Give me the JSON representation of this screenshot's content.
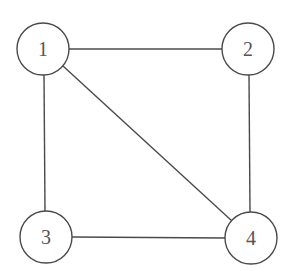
{
  "diagram": {
    "type": "undirected-graph",
    "colors": {
      "stroke": "#4a4a4a",
      "label": "#555555",
      "background": "#ffffff",
      "node_fill": "#ffffff"
    },
    "nodes": [
      {
        "id": "1",
        "label": "1",
        "cx": 43,
        "cy": 49,
        "r": 26
      },
      {
        "id": "2",
        "label": "2",
        "cx": 248,
        "cy": 49,
        "r": 26
      },
      {
        "id": "3",
        "label": "3",
        "cx": 46,
        "cy": 237,
        "r": 26
      },
      {
        "id": "4",
        "label": "4",
        "cx": 251,
        "cy": 238,
        "r": 26
      }
    ],
    "edges": [
      {
        "from": "1",
        "to": "2"
      },
      {
        "from": "1",
        "to": "3"
      },
      {
        "from": "1",
        "to": "4"
      },
      {
        "from": "2",
        "to": "4"
      },
      {
        "from": "3",
        "to": "4"
      }
    ]
  }
}
